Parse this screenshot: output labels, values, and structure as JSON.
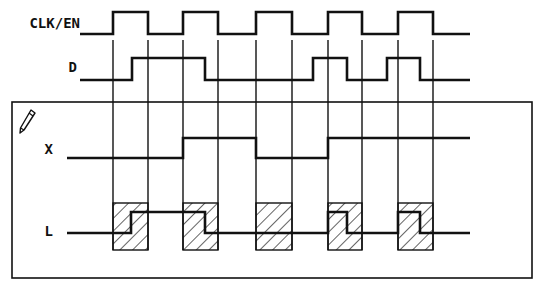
{
  "diagram": {
    "type": "timing-diagram",
    "signals": [
      {
        "name": "CLK/EN",
        "label_pos": [
          80,
          28
        ],
        "low_y": 34,
        "high_y": 12,
        "start_x": 80,
        "end_x": 470,
        "initial": 0,
        "transitions": [
          113,
          148,
          183,
          218,
          256,
          292,
          328,
          362,
          398,
          433
        ]
      },
      {
        "name": "D",
        "label_pos": [
          77,
          72
        ],
        "low_y": 80,
        "high_y": 58,
        "start_x": 80,
        "end_x": 470,
        "initial": 0,
        "transitions": [
          132,
          205,
          313,
          347,
          387,
          420
        ]
      },
      {
        "name": "X",
        "label_pos": [
          53,
          154
        ],
        "low_y": 158,
        "high_y": 138,
        "start_x": 67,
        "end_x": 470,
        "initial": 0,
        "transitions": [
          183,
          256,
          328
        ]
      },
      {
        "name": "L",
        "label_pos": [
          53,
          236
        ],
        "low_y": 233,
        "high_y": 212,
        "start_x": 67,
        "end_x": 470,
        "initial": 0,
        "transitions": [
          131,
          205,
          328,
          347,
          398,
          420
        ]
      }
    ],
    "clock_edge_lines": {
      "x": [
        113,
        148,
        183,
        218,
        256,
        292,
        328,
        362,
        398,
        433
      ],
      "top_y": 40,
      "bottom_y": 250
    },
    "hatched_windows": {
      "top_y": 203,
      "bottom_y": 250,
      "ranges": [
        [
          113,
          148
        ],
        [
          183,
          218
        ],
        [
          256,
          292
        ],
        [
          328,
          362
        ],
        [
          398,
          433
        ]
      ]
    },
    "frame": {
      "x": 12,
      "y": 102,
      "width": 520,
      "height": 176
    },
    "icon": "pencil-icon",
    "colors": {
      "ink": "#111111",
      "background": "#ffffff"
    }
  }
}
